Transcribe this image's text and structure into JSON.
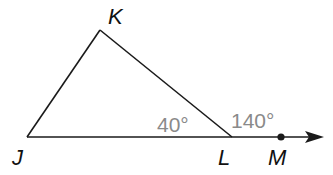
{
  "diagram": {
    "colors": {
      "line": "#1a1a1a",
      "vertex_label": "#111111",
      "angle_label": "#8a8a8a",
      "background": "#ffffff"
    },
    "points": {
      "J": {
        "label": "J",
        "x": 27,
        "y": 137
      },
      "K": {
        "label": "K",
        "x": 100,
        "y": 30
      },
      "L": {
        "label": "L",
        "x": 232,
        "y": 137
      },
      "M": {
        "label": "M",
        "x": 281,
        "y": 137
      }
    },
    "segments": [
      {
        "from": "J",
        "to": "K"
      },
      {
        "from": "K",
        "to": "L"
      },
      {
        "from": "J",
        "to": "L"
      }
    ],
    "ray": {
      "from": "L",
      "through": "M",
      "label": "ray LM"
    },
    "angles": {
      "interior_L": {
        "label": "40°",
        "vertex": "L",
        "description": "angle KLJ"
      },
      "exterior_L": {
        "label": "140°",
        "vertex": "L",
        "description": "angle KLM"
      }
    }
  }
}
